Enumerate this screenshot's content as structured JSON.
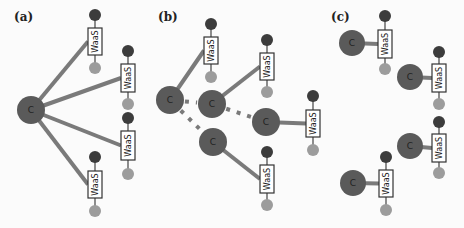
{
  "colors": {
    "background": "#fbfbfb",
    "controller": "#5a5a5a",
    "link": "#7a7a7a",
    "node_dark": "#3c3c3c",
    "node_light": "#9c9c9c",
    "box_border": "#333333",
    "box_fill": "#ffffff"
  },
  "node_labels": {
    "controller": "C",
    "service": "WaaS"
  },
  "panels": [
    {
      "label": "(a)",
      "label_pos": [
        14,
        21
      ],
      "controllers": [
        {
          "x": 31,
          "y": 110,
          "r": 14
        }
      ],
      "services": [
        {
          "x": 95,
          "dark_y": 15,
          "box_top": 28,
          "box_bottom": 55,
          "light_y": 68
        },
        {
          "x": 128,
          "dark_y": 51,
          "box_top": 64,
          "box_bottom": 92,
          "light_y": 104
        },
        {
          "x": 128,
          "dark_y": 118,
          "box_top": 131,
          "box_bottom": 160,
          "light_y": 174
        },
        {
          "x": 95,
          "dark_y": 157,
          "box_top": 171,
          "box_bottom": 198,
          "light_y": 211
        }
      ],
      "links": [
        [
          0,
          0
        ],
        [
          0,
          1
        ],
        [
          0,
          2
        ],
        [
          0,
          3
        ]
      ],
      "peer_links": []
    },
    {
      "label": "(b)",
      "label_pos": [
        158,
        21
      ],
      "controllers": [
        {
          "x": 170,
          "y": 100,
          "r": 14
        },
        {
          "x": 212,
          "y": 104,
          "r": 14
        },
        {
          "x": 266,
          "y": 122,
          "r": 14
        },
        {
          "x": 213,
          "y": 142,
          "r": 14
        }
      ],
      "services": [
        {
          "x": 211,
          "dark_y": 24,
          "box_top": 37,
          "box_bottom": 64,
          "light_y": 77
        },
        {
          "x": 267,
          "dark_y": 40,
          "box_top": 53,
          "box_bottom": 80,
          "light_y": 92
        },
        {
          "x": 313,
          "dark_y": 96,
          "box_top": 110,
          "box_bottom": 137,
          "light_y": 150
        },
        {
          "x": 267,
          "dark_y": 152,
          "box_top": 165,
          "box_bottom": 193,
          "light_y": 205
        }
      ],
      "links": [
        [
          0,
          0
        ],
        [
          1,
          1
        ],
        [
          2,
          2
        ],
        [
          3,
          3
        ]
      ],
      "peer_links": [
        [
          0,
          1
        ],
        [
          1,
          2
        ],
        [
          0,
          3
        ]
      ]
    },
    {
      "label": "(c)",
      "label_pos": [
        331,
        21
      ],
      "controllers": [
        {
          "x": 352,
          "y": 43,
          "r": 13
        },
        {
          "x": 410,
          "y": 77,
          "r": 13
        },
        {
          "x": 410,
          "y": 146,
          "r": 13
        },
        {
          "x": 353,
          "y": 183,
          "r": 13
        }
      ],
      "services": [
        {
          "x": 385,
          "dark_y": 16,
          "box_top": 30,
          "box_bottom": 58,
          "light_y": 69
        },
        {
          "x": 439,
          "dark_y": 52,
          "box_top": 64,
          "box_bottom": 92,
          "light_y": 104
        },
        {
          "x": 439,
          "dark_y": 122,
          "box_top": 134,
          "box_bottom": 162,
          "light_y": 173
        },
        {
          "x": 386,
          "dark_y": 157,
          "box_top": 170,
          "box_bottom": 197,
          "light_y": 210
        }
      ],
      "links": [
        [
          0,
          0
        ],
        [
          1,
          1
        ],
        [
          2,
          2
        ],
        [
          3,
          3
        ]
      ],
      "peer_links": []
    }
  ]
}
